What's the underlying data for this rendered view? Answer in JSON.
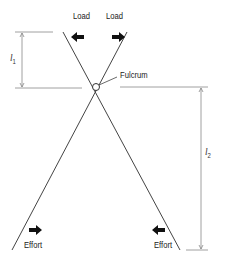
{
  "diagram": {
    "type": "scissors-lever",
    "labels": {
      "load_left": "Load",
      "load_right": "Load",
      "fulcrum": "Fulcrum",
      "effort_left": "Effort",
      "effort_right": "Effort",
      "l1_symbol": "l",
      "l1_sub": "1",
      "l2_symbol": "l",
      "l2_sub": "2"
    },
    "arrows": {
      "load_left": "left-arrow",
      "load_right": "right-arrow",
      "effort_left": "right-arrow",
      "effort_right": "left-arrow"
    },
    "colors": {
      "line": "#444444",
      "arrow": "#111111",
      "dimension": "#777777"
    }
  }
}
